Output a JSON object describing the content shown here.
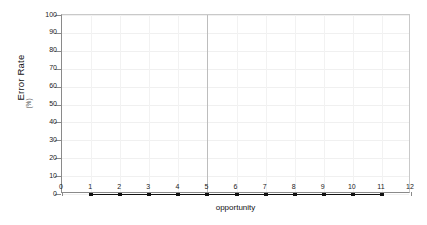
{
  "chart_data": {
    "type": "line",
    "title": "",
    "xlabel": "opportunity",
    "ylabel": "Error Rate",
    "ylabel_unit": "(%)",
    "xlim": [
      0,
      12
    ],
    "ylim": [
      0,
      100
    ],
    "grid": true,
    "legend": "none",
    "x_ticks": [
      "0",
      "1",
      "2",
      "3",
      "4",
      "5",
      "6",
      "7",
      "8",
      "9",
      "10",
      "11",
      "12"
    ],
    "y_ticks": [
      "0",
      "10",
      "20",
      "30",
      "40",
      "50",
      "60",
      "70",
      "80",
      "90",
      "100"
    ],
    "x": [
      1,
      2,
      3,
      4,
      5,
      6,
      7,
      8,
      9,
      10,
      11
    ],
    "series": [
      {
        "name": "Error Rate",
        "color": "#111111",
        "values": [
          0,
          0,
          0,
          0,
          0,
          0,
          0,
          0,
          0,
          0,
          0
        ]
      }
    ],
    "annotations": [
      {
        "name": "reference-line",
        "axis": "x",
        "value": 5
      }
    ]
  },
  "colors": {
    "axis": "#8a8a8a",
    "grid": "#f0f0f0",
    "grid_major": "#bdbdbd",
    "series": "#111111",
    "background": "#ffffff"
  }
}
